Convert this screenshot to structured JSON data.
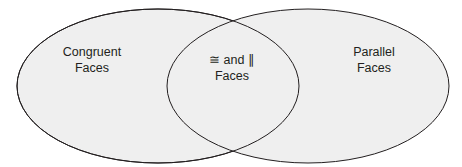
{
  "diagram": {
    "type": "venn",
    "fill_color": "#efefef",
    "stroke_color": "#231f20",
    "sets": [
      {
        "name": "left",
        "line1": "Congruent",
        "line2": "Faces"
      },
      {
        "name": "right",
        "line1": "Parallel",
        "line2": "Faces"
      }
    ],
    "intersection": {
      "line1": "≅ and ∥",
      "line2": "Faces"
    }
  }
}
